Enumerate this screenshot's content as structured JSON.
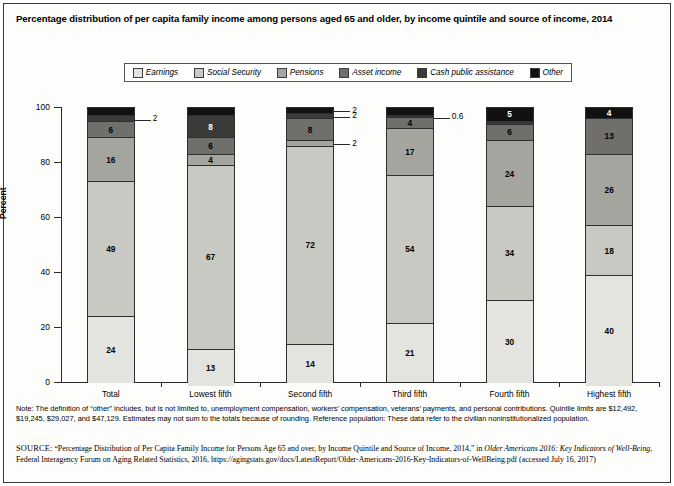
{
  "title": "Percentage distribution of per capita family income among persons aged 65 and older, by income quintile and source of income, 2014",
  "legend": {
    "items": [
      {
        "label": "Earnings",
        "color": "#e3e3df"
      },
      {
        "label": "Social Security",
        "color": "#c9c9c4"
      },
      {
        "label": "Pensions",
        "color": "#a5a5a0"
      },
      {
        "label": "Asset income",
        "color": "#6f6f6b"
      },
      {
        "label": "Cash public assistance",
        "color": "#3a3a38"
      },
      {
        "label": "Other",
        "color": "#111111"
      }
    ]
  },
  "axes": {
    "ylabel": "Percent",
    "yticks": [
      "0",
      "20",
      "40",
      "60",
      "80",
      "100"
    ],
    "ylim": [
      0,
      100
    ]
  },
  "chart_data": {
    "type": "bar",
    "title": "Percentage distribution of per capita family income among persons aged 65 and older, by income quintile and source of income, 2014",
    "xlabel": "",
    "ylabel": "Percent",
    "ylim": [
      0,
      100
    ],
    "stacked": true,
    "grid": false,
    "legend_position": "top",
    "categories": [
      "Total",
      "Lowest fifth",
      "Second fifth",
      "Third fifth",
      "Fourth fifth",
      "Highest fifth"
    ],
    "series": [
      {
        "name": "Earnings",
        "color": "#e3e3df",
        "values": [
          24,
          13,
          14,
          21,
          30,
          40
        ]
      },
      {
        "name": "Social Security",
        "color": "#c9c9c4",
        "values": [
          49,
          67,
          72,
          54,
          34,
          18
        ]
      },
      {
        "name": "Pensions",
        "color": "#a5a5a0",
        "values": [
          16,
          4,
          2,
          17,
          24,
          26
        ]
      },
      {
        "name": "Asset income",
        "color": "#6f6f6b",
        "values": [
          6,
          6,
          8,
          4,
          6,
          13
        ]
      },
      {
        "name": "Cash public assistance",
        "color": "#3a3a38",
        "values": [
          2,
          8,
          2,
          0.6,
          1,
          0
        ]
      },
      {
        "name": "Other",
        "color": "#111111",
        "values": [
          3,
          3,
          2,
          3,
          5,
          4
        ]
      }
    ],
    "labels": {
      "Total": [
        "24",
        "49",
        "16",
        "6",
        "2",
        "3"
      ],
      "Lowest fifth": [
        "13",
        "67",
        "4",
        "6",
        "8",
        "3"
      ],
      "Second fifth": [
        "14",
        "72",
        "2",
        "8",
        "2",
        "2"
      ],
      "Third fifth": [
        "21",
        "54",
        "17",
        "4",
        "0.6",
        "3"
      ],
      "Fourth fifth": [
        "30",
        "34",
        "24",
        "6",
        "",
        "5"
      ],
      "Highest fifth": [
        "40",
        "18",
        "26",
        "13",
        "",
        "4"
      ]
    },
    "callouts": [
      {
        "category": "Total",
        "series": "Cash public assistance",
        "text": "2"
      },
      {
        "category": "Second fifth",
        "series": "Other",
        "text": "2"
      },
      {
        "category": "Second fifth",
        "series": "Cash public assistance",
        "text": "2"
      },
      {
        "category": "Second fifth",
        "series": "Pensions",
        "text": "2"
      },
      {
        "category": "Third fifth",
        "series": "Cash public assistance",
        "text": "0.6"
      }
    ]
  },
  "note": "Note: The definition of “other” includes, but is not limited to, unemployment compensation, workers’ compensation, veterans’ payments, and personal contributions. Quintile limits are $12,492, $19,245, $29,027, and $47,129. Estimates may not sum to the totals because of rounding. Reference population: These data refer to the civilian noninstitutionalized population.",
  "source": {
    "prefix": "SOURCE:",
    "line1": " “Percentage Distribution of Per Capita Family Income for Persons Age 65 and over, by Income Quintile and Source of Income, 2014,” in ",
    "italic": "Older Americans 2016: Key Indicators of Well-Being",
    "line2": ", Federal Interagency Forum on Aging Related Statistics, 2016, https://agingstats.gov/docs/LatestReport/Older-Americans-2016-Key-Indicators-of-WellBeing.pdf (accessed July 16, 2017)"
  }
}
